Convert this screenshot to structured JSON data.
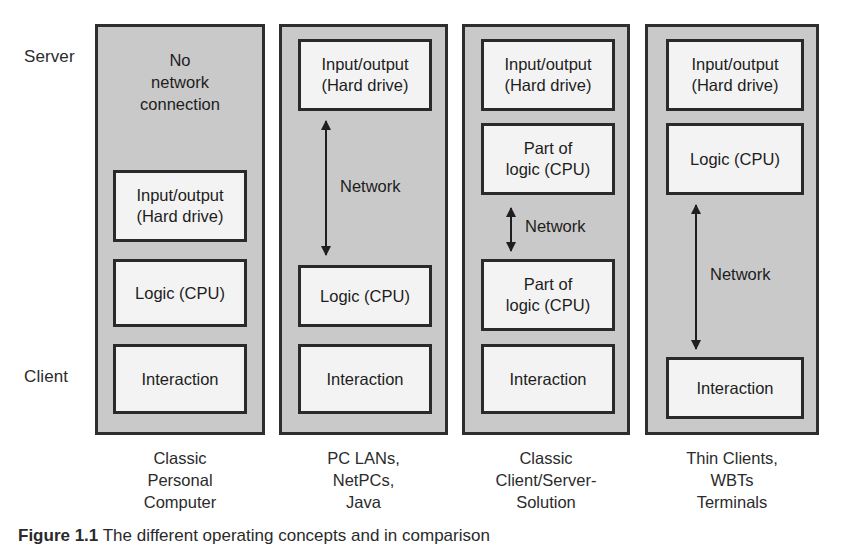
{
  "diagram": {
    "row_labels": {
      "server": "Server",
      "client": "Client"
    },
    "network_label": "Network",
    "columns": [
      {
        "id": "classic-personal-computer",
        "caption": [
          "Classic",
          "Personal",
          "Computer"
        ],
        "blocks": [
          {
            "kind": "plain",
            "lines": [
              "No",
              "network",
              "connection"
            ]
          },
          {
            "kind": "box",
            "lines": [
              "Input/output",
              "(Hard drive)"
            ]
          },
          {
            "kind": "box",
            "lines": [
              "Logic (CPU)"
            ]
          },
          {
            "kind": "box",
            "lines": [
              "Interaction"
            ]
          }
        ],
        "has_network_arrow": false
      },
      {
        "id": "pc-lans-netpcs-java",
        "caption": [
          "PC LANs,",
          "NetPCs,",
          "Java"
        ],
        "blocks": [
          {
            "kind": "box",
            "lines": [
              "Input/output",
              "(Hard drive)"
            ]
          },
          {
            "kind": "arrow",
            "lines": [
              "Network"
            ]
          },
          {
            "kind": "box",
            "lines": [
              "Logic (CPU)"
            ]
          },
          {
            "kind": "box",
            "lines": [
              "Interaction"
            ]
          }
        ],
        "has_network_arrow": true
      },
      {
        "id": "classic-client-server-solution",
        "caption": [
          "Classic",
          "Client/Server-",
          "Solution"
        ],
        "blocks": [
          {
            "kind": "box",
            "lines": [
              "Input/output",
              "(Hard drive)"
            ]
          },
          {
            "kind": "box",
            "lines": [
              "Part of",
              "logic (CPU)"
            ]
          },
          {
            "kind": "arrow",
            "lines": [
              "Network"
            ]
          },
          {
            "kind": "box",
            "lines": [
              "Part of",
              "logic (CPU)"
            ]
          },
          {
            "kind": "box",
            "lines": [
              "Interaction"
            ]
          }
        ],
        "has_network_arrow": true
      },
      {
        "id": "thin-clients-wbts-terminals",
        "caption": [
          "Thin Clients,",
          "WBTs",
          "Terminals"
        ],
        "blocks": [
          {
            "kind": "box",
            "lines": [
              "Input/output",
              "(Hard drive)"
            ]
          },
          {
            "kind": "box",
            "lines": [
              "Logic (CPU)"
            ]
          },
          {
            "kind": "arrow",
            "lines": [
              "Network"
            ]
          },
          {
            "kind": "box",
            "lines": [
              "Interaction"
            ]
          }
        ],
        "has_network_arrow": true
      }
    ]
  },
  "figure_caption": {
    "number": "Figure 1.1",
    "text": "The different operating concepts and in comparison"
  },
  "colors": {
    "panel_fill": "#c9c9c9",
    "box_fill": "#f3f3f3",
    "border": "#2a2a2a",
    "text": "#1d1d1d",
    "page_background": "#ffffff"
  }
}
